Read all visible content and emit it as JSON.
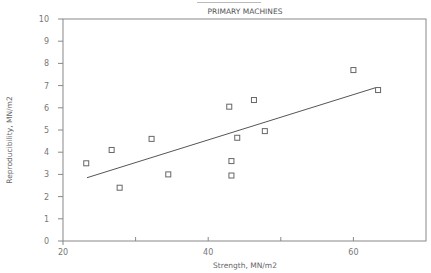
{
  "chart_data": {
    "type": "scatter",
    "title": "PRIMARY MACHINES",
    "xlabel": "Strength, MN/m2",
    "ylabel": "Reproducibility, MN/m2",
    "xlim": [
      20,
      70
    ],
    "ylim": [
      0,
      10
    ],
    "x_ticks": [
      20,
      30,
      40,
      50,
      60,
      70
    ],
    "x_tick_labels": [
      "20",
      "",
      "40",
      "",
      "60",
      ""
    ],
    "y_ticks": [
      0,
      1,
      2,
      3,
      4,
      5,
      6,
      7,
      8,
      9,
      10
    ],
    "y_tick_labels": [
      "0",
      "1",
      "2",
      "3",
      "4",
      "5",
      "6",
      "7",
      "8",
      "9",
      "10"
    ],
    "grid": false,
    "legend": null,
    "marker": "open-square",
    "series": [
      {
        "name": "Primary machines",
        "points": [
          {
            "x": 23.2,
            "y": 3.5
          },
          {
            "x": 26.7,
            "y": 4.1
          },
          {
            "x": 27.8,
            "y": 2.4
          },
          {
            "x": 32.2,
            "y": 4.6
          },
          {
            "x": 34.5,
            "y": 3.0
          },
          {
            "x": 42.9,
            "y": 6.05
          },
          {
            "x": 43.2,
            "y": 3.6
          },
          {
            "x": 43.2,
            "y": 2.95
          },
          {
            "x": 44.0,
            "y": 4.65
          },
          {
            "x": 46.3,
            "y": 6.35
          },
          {
            "x": 47.8,
            "y": 4.95
          },
          {
            "x": 60.0,
            "y": 7.7
          },
          {
            "x": 63.4,
            "y": 6.8
          }
        ]
      }
    ],
    "trend_line": {
      "type": "linear-fit",
      "start": {
        "x": 23.3,
        "y": 2.85
      },
      "end": {
        "x": 63.0,
        "y": 6.9
      }
    }
  },
  "colors": {
    "axis": "#888888",
    "marker": "#666666",
    "line": "#555555"
  }
}
